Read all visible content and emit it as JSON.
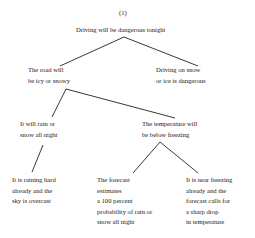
{
  "diagram": {
    "label": "(1)",
    "type": "argument-tree",
    "root": {
      "lines": [
        "Driving will be dangerous tonight"
      ]
    },
    "level1": [
      {
        "lines": [
          "The road will",
          "be icy or snowy"
        ]
      },
      {
        "lines": [
          "Driving on snow",
          "or ice is dangerous"
        ]
      }
    ],
    "level2": [
      {
        "lines": [
          "It will rain or",
          "snow all night"
        ]
      },
      {
        "lines": [
          "The temperature will",
          "be below freezing"
        ]
      }
    ],
    "level3": [
      {
        "lines": [
          "It is raining hard",
          "already and the",
          "sky is overcast"
        ]
      },
      {
        "lines": [
          "The forecast",
          "estimates",
          "a 100 percent",
          "probability of rain or",
          "snow all night"
        ]
      },
      {
        "lines": [
          "It is near freezing",
          "already and the",
          "forecast calls for",
          "a sharp drop",
          "in temperature"
        ]
      }
    ],
    "edges": [
      {
        "from": "Driving will be dangerous tonight",
        "to": "The road will be icy or snowy"
      },
      {
        "from": "Driving will be dangerous tonight",
        "to": "Driving on snow or ice is dangerous"
      },
      {
        "from": "The road will be icy or snowy",
        "to": "It will rain or snow all night"
      },
      {
        "from": "The road will be icy or snowy",
        "to": "The temperature will be below freezing"
      },
      {
        "from": "It will rain or snow all night",
        "to": "It is raining hard already and the sky is overcast"
      },
      {
        "from": "The temperature will be below freezing",
        "to": "The forecast estimates a 100 percent probability of rain or snow all night"
      },
      {
        "from": "The temperature will be below freezing",
        "to": "It is near freezing already and the forecast calls for a sharp drop in temperature"
      }
    ]
  }
}
